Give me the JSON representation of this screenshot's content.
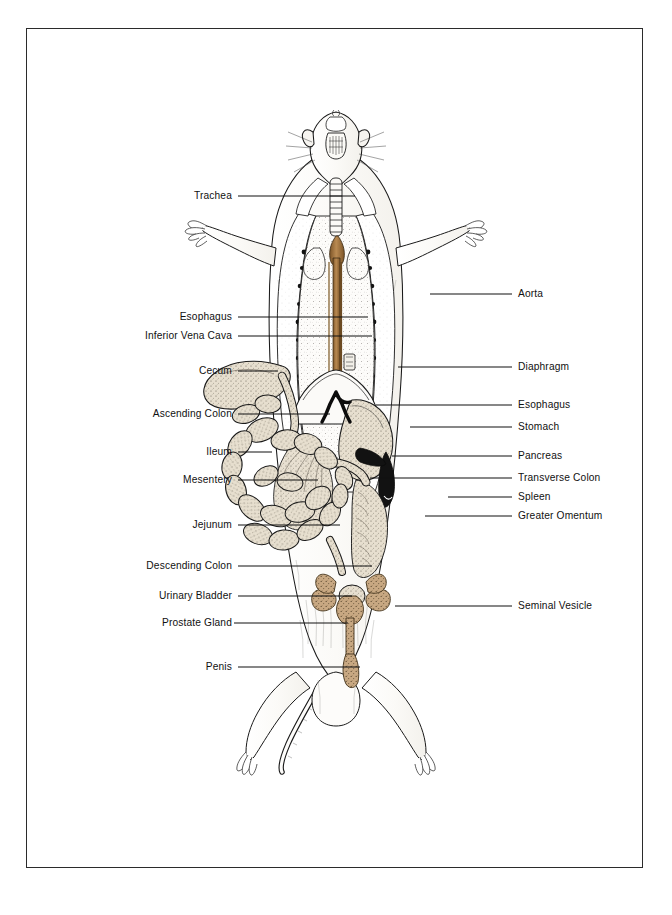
{
  "figure": {
    "background_color": "#ffffff",
    "border_color": "#2b2b2b",
    "ink_color": "#111111",
    "organ_fill": "#e7dfcf",
    "organ_fill_deep": "#c8a882",
    "vessel_brown": "#a87a48",
    "fur_fill": "#fbfaf8",
    "leader_color": "#111111"
  },
  "labels_left": [
    {
      "id": "trachea",
      "text": "Trachea",
      "text_x": 232,
      "y": 196,
      "line_x1": 238,
      "line_x2": 355,
      "target_x": 372,
      "target_y": 196
    },
    {
      "id": "esophagus-upper",
      "text": "Esophagus",
      "text_x": 232,
      "y": 317,
      "line_x1": 238,
      "line_x2": 368,
      "target_x": 378,
      "target_y": 317
    },
    {
      "id": "inferior-vena-cava",
      "text": "Inferior Vena Cava",
      "text_x": 232,
      "y": 336,
      "line_x1": 238,
      "line_x2": 372,
      "target_x": 383,
      "target_y": 336
    },
    {
      "id": "cecum",
      "text": "Cecum",
      "text_x": 232,
      "y": 371,
      "line_x1": 238,
      "line_x2": 278,
      "target_x": 278,
      "target_y": 371
    },
    {
      "id": "ascending-colon",
      "text": "Ascending Colon",
      "text_x": 232,
      "y": 414,
      "line_x1": 238,
      "line_x2": 330,
      "target_x": 330,
      "target_y": 414
    },
    {
      "id": "ileum",
      "text": "Ileum",
      "text_x": 232,
      "y": 452,
      "line_x1": 238,
      "line_x2": 272,
      "target_x": 272,
      "target_y": 452
    },
    {
      "id": "mesentery",
      "text": "Mesentery",
      "text_x": 232,
      "y": 480,
      "line_x1": 238,
      "line_x2": 318,
      "target_x": 318,
      "target_y": 480
    },
    {
      "id": "jejunum",
      "text": "Jejunum",
      "text_x": 232,
      "y": 525,
      "line_x1": 238,
      "line_x2": 340,
      "target_x": 340,
      "target_y": 525
    },
    {
      "id": "descending-colon",
      "text": "Descending Colon",
      "text_x": 232,
      "y": 566,
      "line_x1": 238,
      "line_x2": 372,
      "target_x": 372,
      "target_y": 566
    },
    {
      "id": "urinary-bladder",
      "text": "Urinary Bladder",
      "text_x": 232,
      "y": 596,
      "line_x1": 238,
      "line_x2": 352,
      "target_x": 352,
      "target_y": 596
    },
    {
      "id": "prostate-gland",
      "text": "Prostate Gland",
      "text_x": 232,
      "y": 623,
      "line_x1": 234,
      "line_x2": 348,
      "target_x": 348,
      "target_y": 623
    },
    {
      "id": "penis",
      "text": "Penis",
      "text_x": 232,
      "y": 667,
      "line_x1": 238,
      "line_x2": 360,
      "target_x": 360,
      "target_y": 667
    }
  ],
  "labels_right": [
    {
      "id": "aorta",
      "text": "Aorta",
      "text_x": 518,
      "y": 294,
      "line_x1": 430,
      "line_x2": 512,
      "target_x": 430,
      "target_y": 294
    },
    {
      "id": "diaphragm",
      "text": "Diaphragm",
      "text_x": 518,
      "y": 367,
      "line_x1": 398,
      "line_x2": 512,
      "target_x": 398,
      "target_y": 367
    },
    {
      "id": "esophagus-lower",
      "text": "Esophagus",
      "text_x": 518,
      "y": 405,
      "line_x1": 376,
      "line_x2": 512,
      "target_x": 376,
      "target_y": 405
    },
    {
      "id": "stomach",
      "text": "Stomach",
      "text_x": 518,
      "y": 427,
      "line_x1": 410,
      "line_x2": 512,
      "target_x": 410,
      "target_y": 427
    },
    {
      "id": "pancreas",
      "text": "Pancreas",
      "text_x": 518,
      "y": 456,
      "line_x1": 392,
      "line_x2": 512,
      "target_x": 392,
      "target_y": 456
    },
    {
      "id": "transverse-colon",
      "text": "Transverse Colon",
      "text_x": 518,
      "y": 478,
      "line_x1": 370,
      "line_x2": 512,
      "target_x": 370,
      "target_y": 478
    },
    {
      "id": "spleen",
      "text": "Spleen",
      "text_x": 518,
      "y": 497,
      "line_x1": 448,
      "line_x2": 512,
      "target_x": 448,
      "target_y": 497
    },
    {
      "id": "greater-omentum",
      "text": "Greater Omentum",
      "text_x": 518,
      "y": 516,
      "line_x1": 425,
      "line_x2": 512,
      "target_x": 425,
      "target_y": 516
    },
    {
      "id": "seminal-vesicle",
      "text": "Seminal Vesicle",
      "text_x": 518,
      "y": 606,
      "line_x1": 395,
      "line_x2": 512,
      "target_x": 395,
      "target_y": 606
    }
  ]
}
